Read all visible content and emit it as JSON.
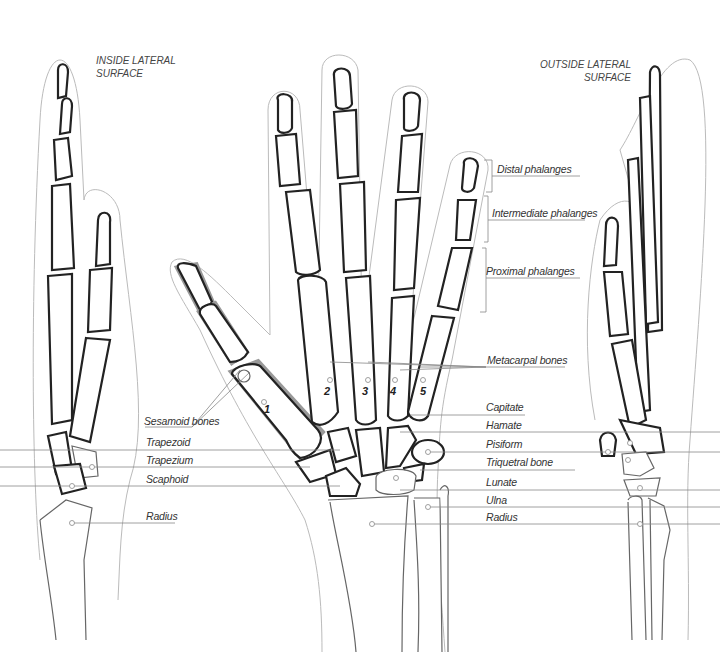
{
  "titles": {
    "left": [
      "INSIDE LATERAL",
      "SURFACE"
    ],
    "right": [
      "OUTSIDE LATERAL",
      "SURFACE"
    ]
  },
  "labels_right": {
    "distal": "Distal phalanges",
    "intermediate": "Intermediate phalanges",
    "proximal": "Proximal phalanges",
    "metacarpal": "Metacarpal bones",
    "capitate": "Capitate",
    "hamate": "Hamate",
    "pisiform": "Pisiform",
    "triquetral": "Triquetral bone",
    "lunate": "Lunate",
    "ulna": "Ulna",
    "radius": "Radius"
  },
  "labels_left": {
    "sesamoid": "Sesamoid bones",
    "trapezoid": "Trapezoid",
    "trapezium": "Trapezium",
    "scaphoid": "Scaphoid",
    "radius": "Radius"
  },
  "metacarpal_numbers": [
    "1",
    "2",
    "3",
    "4",
    "5"
  ],
  "colors": {
    "bone_outline": "#222222",
    "halo": "#999999",
    "skin_outline": "#bbbbbb",
    "leader_line": "#888888",
    "text": "#333333"
  }
}
